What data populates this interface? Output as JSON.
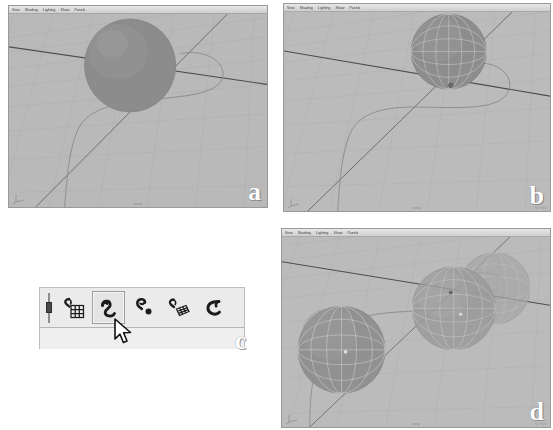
{
  "figure": {
    "panels": [
      "a",
      "b",
      "c",
      "d"
    ]
  },
  "viewport_menu": {
    "items": [
      "View",
      "Shading",
      "Lighting",
      "Show",
      "Panels"
    ]
  },
  "panel_a": {
    "label": "a",
    "caption": "persp",
    "caption_right": "",
    "gizmo_name": "axis-indicator"
  },
  "panel_b": {
    "label": "b",
    "caption": "persp",
    "caption_right": "Top View",
    "gizmo_name": "axis-indicator"
  },
  "panel_c": {
    "label": "c",
    "toolbar_name": "snap-toolbar",
    "buttons": [
      {
        "name": "snap-to-grid-icon",
        "label": "Snap to grids",
        "active": false
      },
      {
        "name": "snap-to-curve-icon",
        "label": "Snap to curves",
        "active": true
      },
      {
        "name": "snap-to-point-icon",
        "label": "Snap to points",
        "active": false
      },
      {
        "name": "snap-to-view-plane-icon",
        "label": "Snap to view planes",
        "active": false
      },
      {
        "name": "snap-to-curve-end-icon",
        "label": "Snap to curve ends",
        "active": false
      }
    ],
    "cursor": "arrow-pointer"
  },
  "panel_d": {
    "label": "d",
    "caption": "persp",
    "caption_right": "Top View",
    "gizmo_name": "axis-indicator",
    "sphere_count": 3
  },
  "colors": {
    "page_background": "#ffffff",
    "viewport_background": "#b9b9b9",
    "grid_line": "#aaaaaa",
    "axis_line": "#4c4c4c",
    "curve": "#8a8a8a",
    "sphere_fill": "#8f8f8f",
    "sphere_wire": "#d8d8d8",
    "toolbar_background": "#efefef",
    "toolbar_button_active": "#e4e4e4",
    "badge_text": "#ffffff"
  }
}
